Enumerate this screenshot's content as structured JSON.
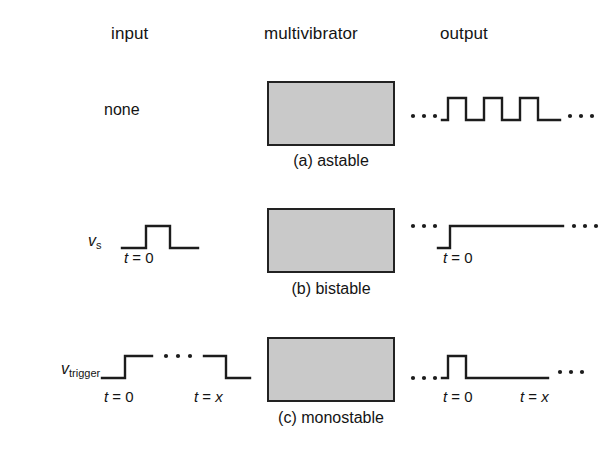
{
  "figure": {
    "headers": {
      "input": "input",
      "multivibrator": "multivibrator",
      "output": "output"
    },
    "captions": {
      "a": "(a) astable",
      "b": "(b) bistable",
      "c": "(c) monostable"
    },
    "rows": [
      {
        "id": "astable",
        "caption": "(a) astable",
        "input_label": "none",
        "input_time_labels": [],
        "output_time_labels": [],
        "input_waveform": "none",
        "output_waveform": "continuous square wave, 3 pulses, ellipsis both sides"
      },
      {
        "id": "bistable",
        "caption": "(b) bistable",
        "input_label": "v",
        "input_label_sub": "s",
        "input_time_labels": [
          "t = 0"
        ],
        "output_time_labels": [
          "t = 0"
        ],
        "input_waveform": "single rectangular pulse",
        "output_waveform": "rising step held high, ellipsis both sides"
      },
      {
        "id": "monostable",
        "caption": "(c) monostable",
        "input_label": "v",
        "input_label_sub": "trigger",
        "input_time_labels": [
          "t = 0",
          "t = x"
        ],
        "output_time_labels": [
          "t = 0",
          "t = x"
        ],
        "input_waveform": "wide pulse with ellipsis across high level",
        "output_waveform": "narrow pulse at t=0 then low, ellipsis both sides"
      }
    ],
    "time_labels": {
      "t_zero_var": "t",
      "t_zero_eq": " = ",
      "t_zero_val": "0",
      "t_x_var": "t",
      "t_x_eq": " = ",
      "t_x_val": "x"
    },
    "colors": {
      "box_fill": "#c9c9c9",
      "box_border": "#222222",
      "line": "#1c1c1c",
      "text": "#141414",
      "background": "#ffffff"
    }
  }
}
